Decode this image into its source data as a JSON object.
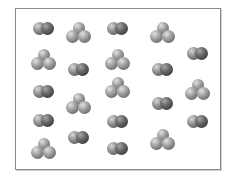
{
  "diagram": {
    "title": "",
    "frame": {
      "x": 15,
      "y": 8,
      "width": 205,
      "height": 161,
      "border_color": "#8a8a8a"
    },
    "legend": [],
    "molecule_types": {
      "diatomic": "two-atom molecule (two overlapping gray spheres)",
      "triatomic": "three-atom cluster (one sphere on top, two below)"
    },
    "counts": {
      "diatomic": 12,
      "triatomic": 9,
      "total": 21
    },
    "molecules": [
      {
        "type": "diatomic",
        "cx": 44,
        "cy": 28
      },
      {
        "type": "triatomic",
        "cx": 79,
        "cy": 32
      },
      {
        "type": "diatomic",
        "cx": 118,
        "cy": 28
      },
      {
        "type": "triatomic",
        "cx": 163,
        "cy": 32
      },
      {
        "type": "triatomic",
        "cx": 44,
        "cy": 59
      },
      {
        "type": "diatomic",
        "cx": 79,
        "cy": 69
      },
      {
        "type": "triatomic",
        "cx": 118,
        "cy": 59
      },
      {
        "type": "diatomic",
        "cx": 163,
        "cy": 69
      },
      {
        "type": "diatomic",
        "cx": 198,
        "cy": 53
      },
      {
        "type": "diatomic",
        "cx": 44,
        "cy": 91
      },
      {
        "type": "triatomic",
        "cx": 79,
        "cy": 103
      },
      {
        "type": "triatomic",
        "cx": 118,
        "cy": 87
      },
      {
        "type": "diatomic",
        "cx": 163,
        "cy": 103
      },
      {
        "type": "triatomic",
        "cx": 198,
        "cy": 89
      },
      {
        "type": "diatomic",
        "cx": 44,
        "cy": 120
      },
      {
        "type": "diatomic",
        "cx": 118,
        "cy": 121
      },
      {
        "type": "diatomic",
        "cx": 198,
        "cy": 121
      },
      {
        "type": "triatomic",
        "cx": 44,
        "cy": 148
      },
      {
        "type": "diatomic",
        "cx": 79,
        "cy": 137
      },
      {
        "type": "diatomic",
        "cx": 118,
        "cy": 148
      },
      {
        "type": "triatomic",
        "cx": 163,
        "cy": 139
      }
    ],
    "colors": {
      "atom_light": "#9a9a9a",
      "atom_dark": "#454545",
      "background": "#ffffff"
    }
  }
}
